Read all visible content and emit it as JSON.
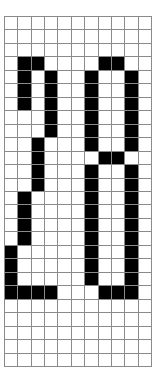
{
  "canvas": {
    "width": 159,
    "height": 383,
    "background": "#ffffff"
  },
  "grid": {
    "name": "pixel-grid",
    "columns": 11,
    "rows": 26,
    "origin_x": 4,
    "origin_y": 16,
    "width": 148,
    "height": 351,
    "cell_width": 13.5,
    "cell_height": 13.5,
    "line_color": "#8a8a8a",
    "fill_color": "#000000",
    "empty_color": "#ffffff"
  },
  "content": {
    "depicted_text": "20",
    "description": "Pixelated digits 20 drawn as filled cells on a grid",
    "filled_cells": [
      [
        3,
        1
      ],
      [
        3,
        2
      ],
      [
        3,
        7
      ],
      [
        3,
        8
      ],
      [
        4,
        1
      ],
      [
        4,
        3
      ],
      [
        4,
        6
      ],
      [
        4,
        9
      ],
      [
        5,
        1
      ],
      [
        5,
        3
      ],
      [
        5,
        6
      ],
      [
        5,
        9
      ],
      [
        6,
        1
      ],
      [
        6,
        3
      ],
      [
        6,
        6
      ],
      [
        6,
        9
      ],
      [
        7,
        3
      ],
      [
        7,
        6
      ],
      [
        7,
        9
      ],
      [
        8,
        3
      ],
      [
        8,
        6
      ],
      [
        8,
        9
      ],
      [
        9,
        2
      ],
      [
        9,
        6
      ],
      [
        9,
        9
      ],
      [
        10,
        2
      ],
      [
        10,
        7
      ],
      [
        10,
        8
      ],
      [
        11,
        2
      ],
      [
        11,
        6
      ],
      [
        11,
        9
      ],
      [
        12,
        2
      ],
      [
        12,
        6
      ],
      [
        12,
        9
      ],
      [
        13,
        1
      ],
      [
        13,
        6
      ],
      [
        13,
        9
      ],
      [
        14,
        1
      ],
      [
        14,
        6
      ],
      [
        14,
        9
      ],
      [
        15,
        1
      ],
      [
        15,
        6
      ],
      [
        15,
        9
      ],
      [
        16,
        1
      ],
      [
        16,
        6
      ],
      [
        16,
        9
      ],
      [
        17,
        0
      ],
      [
        17,
        6
      ],
      [
        17,
        9
      ],
      [
        18,
        0
      ],
      [
        18,
        6
      ],
      [
        18,
        9
      ],
      [
        19,
        0
      ],
      [
        19,
        6
      ],
      [
        19,
        9
      ],
      [
        20,
        0
      ],
      [
        20,
        1
      ],
      [
        20,
        2
      ],
      [
        20,
        3
      ],
      [
        20,
        7
      ],
      [
        20,
        8
      ],
      [
        20,
        9
      ]
    ]
  }
}
